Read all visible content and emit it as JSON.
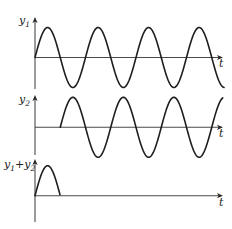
{
  "figure": {
    "time_axis_label": "t",
    "wave": {
      "amplitude": 30,
      "period": 50.5,
      "origin_x": 35,
      "end_x": 223
    },
    "panels": [
      {
        "id": "y1",
        "label_main": "y",
        "label_sub": "1",
        "label_rest": "",
        "baseline_y": 57.5,
        "axis_top": 17,
        "axis_bottom": 89,
        "wave_start_x": 35,
        "wave_end_x": 224,
        "phase_start_x": 35,
        "label_x": 19,
        "label_y": 24,
        "t_y": 67
      },
      {
        "id": "y2",
        "label_main": "y",
        "label_sub": "2",
        "label_rest": "",
        "baseline_y": 127.3,
        "axis_top": 95,
        "axis_bottom": 155,
        "wave_start_x": 60.25,
        "wave_end_x": 223,
        "phase_start_x": 60.25,
        "label_x": 19,
        "label_y": 103,
        "t_y": 137
      },
      {
        "id": "y1_plus_y2",
        "label_main": "y",
        "label_sub": "1",
        "label_rest": "+y",
        "label_sub2": "2",
        "baseline_y": 195.7,
        "axis_top": 159,
        "axis_bottom": 222,
        "wave_start_x": 35,
        "wave_end_x": 60.25,
        "phase_start_x": 35,
        "label_x": 4,
        "label_y": 168,
        "t_y": 206
      }
    ],
    "colors": {
      "wave": "#1e1e1e",
      "axis": "#4a4a4a",
      "background": "#ffffff"
    }
  }
}
